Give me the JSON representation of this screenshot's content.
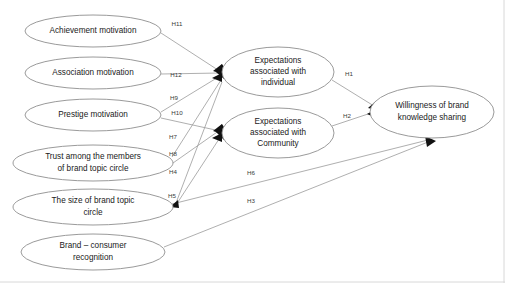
{
  "diagram": {
    "type": "path-model",
    "nodes": [
      {
        "id": "achievement",
        "label": "Achievement motivation",
        "cx": 93,
        "cy": 31,
        "rx": 68,
        "ry": 16,
        "lines": [
          "Achievement motivation"
        ]
      },
      {
        "id": "association",
        "label": "Association motivation",
        "cx": 93,
        "cy": 73,
        "rx": 68,
        "ry": 16,
        "lines": [
          "Association motivation"
        ]
      },
      {
        "id": "prestige",
        "label": "Prestige motivation",
        "cx": 93,
        "cy": 115,
        "rx": 68,
        "ry": 16,
        "lines": [
          "Prestige motivation"
        ]
      },
      {
        "id": "trust",
        "label": "Trust among the members of brand topic circle",
        "cx": 93,
        "cy": 163,
        "rx": 80,
        "ry": 18,
        "lines": [
          "Trust among the members",
          "of brand topic circle"
        ]
      },
      {
        "id": "size",
        "label": "The size of brand topic circle",
        "cx": 93,
        "cy": 207,
        "rx": 80,
        "ry": 18,
        "lines": [
          "The size of brand topic",
          "circle"
        ]
      },
      {
        "id": "recognition",
        "label": "Brand – consumer recognition",
        "cx": 93,
        "cy": 252,
        "rx": 72,
        "ry": 18,
        "lines": [
          "Brand – consumer",
          "recognition"
        ]
      },
      {
        "id": "exp_individual",
        "label": "Expectations associated with individual",
        "cx": 278,
        "cy": 72,
        "rx": 56,
        "ry": 25,
        "lines": [
          "Expectations",
          "associated with",
          "individual"
        ]
      },
      {
        "id": "exp_community",
        "label": "Expectations associated with Community",
        "cx": 278,
        "cy": 133,
        "rx": 56,
        "ry": 25,
        "lines": [
          "Expectations",
          "associated with",
          "Community"
        ]
      },
      {
        "id": "willingness",
        "label": "Willingness of brand knowledge sharing",
        "cx": 432,
        "cy": 112,
        "rx": 62,
        "ry": 26,
        "lines": [
          "Willingness of brand",
          "knowledge sharing"
        ]
      }
    ],
    "edges": [
      {
        "id": "H11",
        "label": "H11",
        "from": "achievement",
        "to": "exp_individual",
        "label_x": 177,
        "label_y": 24
      },
      {
        "id": "H12",
        "label": "H12",
        "from": "association",
        "to": "exp_individual",
        "label_x": 176,
        "label_y": 75
      },
      {
        "id": "H9",
        "label": "H9",
        "from": "prestige",
        "to": "exp_individual",
        "label_x": 174,
        "label_y": 98
      },
      {
        "id": "H10",
        "label": "H10",
        "from": "prestige",
        "to": "exp_community",
        "label_x": 177,
        "label_y": 113
      },
      {
        "id": "H7",
        "label": "H7",
        "from": "trust",
        "to": "exp_individual",
        "label_x": 173,
        "label_y": 137
      },
      {
        "id": "H8",
        "label": "H8",
        "from": "trust",
        "to": "exp_community",
        "label_x": 173,
        "label_y": 154
      },
      {
        "id": "H4",
        "label": "H4",
        "from": "size",
        "to": "exp_individual",
        "label_x": 173,
        "label_y": 172
      },
      {
        "id": "H5",
        "label": "H5",
        "from": "size",
        "to": "exp_community",
        "label_x": 172,
        "label_y": 196
      },
      {
        "id": "H6",
        "label": "H6",
        "from": "size",
        "to": "willingness",
        "label_x": 251,
        "label_y": 173
      },
      {
        "id": "H3",
        "label": "H3",
        "from": "recognition",
        "to": "willingness",
        "label_x": 251,
        "label_y": 201
      },
      {
        "id": "H1",
        "label": "H1",
        "from": "exp_individual",
        "to": "willingness",
        "label_x": 349,
        "label_y": 74
      },
      {
        "id": "H2",
        "label": "H2",
        "from": "exp_community",
        "to": "willingness",
        "label_x": 347,
        "label_y": 116
      }
    ],
    "colors": {
      "node_stroke": "#8f8f8f",
      "edge_stroke": "#9a9a9a",
      "arrow_fill": "#111111",
      "text": "#1a1a1a",
      "background": "#ffffff"
    }
  }
}
